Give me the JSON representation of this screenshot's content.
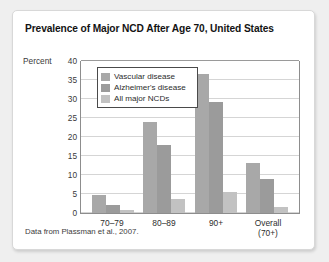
{
  "figure": {
    "title": "Prevalence of Major NCD After Age 70, United States",
    "source_note": "Data from Plassman et al., 2007.",
    "y_axis_unit_label": "Percent",
    "card_background": "#ffffff",
    "page_background": "#efefef"
  },
  "chart_data": {
    "type": "bar",
    "title": "Prevalence of Major NCD After Age 70, United States",
    "xlabel": "",
    "ylabel": "Percent",
    "ylim": [
      0,
      40
    ],
    "yticks": [
      0,
      5,
      10,
      15,
      20,
      25,
      30,
      35,
      40
    ],
    "ytick_labels": [
      "0",
      "5",
      "10",
      "15",
      "20",
      "25",
      "30",
      "35",
      "40"
    ],
    "grid": true,
    "grid_axis": "y",
    "legend_position": "upper-left-inside",
    "categories": [
      "70–79",
      "80–89",
      "90+",
      "Overall (70+)"
    ],
    "series": [
      {
        "name": "Vascular disease",
        "color": "#a8a8a8",
        "values": [
          4.8,
          23.9,
          36.7,
          13.1
        ]
      },
      {
        "name": "Alzheimer's disease",
        "color": "#9b9b9b",
        "values": [
          2.0,
          17.8,
          29.1,
          8.9
        ]
      },
      {
        "name": "All major NCDs",
        "color": "#c2c2c2",
        "values": [
          0.7,
          3.7,
          5.6,
          1.6
        ]
      }
    ],
    "annotations": [
      "Data from Plassman et al., 2007."
    ]
  }
}
